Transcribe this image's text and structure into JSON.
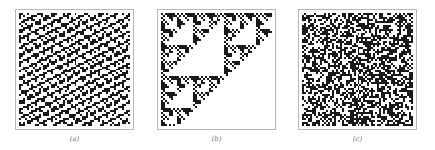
{
  "figure": {
    "panels": [
      {
        "id": "a",
        "label": "(a)",
        "pattern": "periodic-diagonal-texture",
        "ink": "#1a1a1a"
      },
      {
        "id": "b",
        "label": "(b)",
        "pattern": "nested-sierpinski-fractal",
        "ink": "#1a1a1a"
      },
      {
        "id": "c",
        "label": "(c)",
        "pattern": "random-noise",
        "ink": "#1a1a1a"
      }
    ],
    "frame_color": "#b8b8b8",
    "grid_size": 56
  }
}
